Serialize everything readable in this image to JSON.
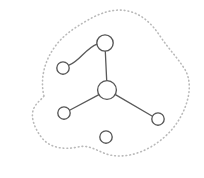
{
  "diagram": {
    "canvas": {
      "width": 204,
      "height": 178,
      "background": "#ffffff"
    },
    "styles": {
      "node_fill": "#ffffff",
      "node_stroke": "#555555",
      "node_stroke_width": 1.35,
      "edge_stroke": "#595959",
      "edge_stroke_width": 1.3,
      "boundary_stroke": "#b9b9b9",
      "boundary_stroke_width": 1.6,
      "boundary_dash": "0.7 3.1"
    },
    "nodes": [
      {
        "id": "n-top",
        "label": "",
        "cx": 105,
        "cy": 43,
        "r": 8.2,
        "size": "medium"
      },
      {
        "id": "n-upper-left",
        "label": "",
        "cx": 63,
        "cy": 68,
        "r": 6.2,
        "size": "small"
      },
      {
        "id": "n-hub",
        "label": "",
        "cx": 107,
        "cy": 90,
        "r": 9.4,
        "size": "large"
      },
      {
        "id": "n-lower-left",
        "label": "",
        "cx": 64,
        "cy": 113,
        "r": 6.2,
        "size": "small"
      },
      {
        "id": "n-lower-right",
        "label": "",
        "cx": 158,
        "cy": 119,
        "r": 6.2,
        "size": "small"
      },
      {
        "id": "n-isolated",
        "label": "",
        "cx": 106,
        "cy": 137,
        "r": 6.2,
        "size": "small"
      }
    ],
    "edges": [
      {
        "id": "e-curved-upperleft-top",
        "from": "n-upper-left",
        "to": "n-top",
        "type": "curved",
        "path": "M 69.0 65.2 C 80.0 61.0 85.5 48.5 96.9 44.1"
      },
      {
        "id": "e-top-hub",
        "from": "n-top",
        "to": "n-hub",
        "type": "straight",
        "path": "M 105.3 51.2 L 106.7 80.6"
      },
      {
        "id": "e-hub-lowerleft",
        "from": "n-hub",
        "to": "n-lower-left",
        "type": "straight",
        "path": "M 99.0 94.6 L 69.6 110.2"
      },
      {
        "id": "e-hub-lowerright",
        "from": "n-hub",
        "to": "n-lower-right",
        "type": "straight",
        "path": "M 115.4 94.6 L 152.4 116.2"
      }
    ],
    "boundary": {
      "id": "region-boundary",
      "type": "closed-dotted-blob",
      "path": "M 44 96 C 40 80 44 62 54 48 C 62 36 74 28 88 20 C 100 13 114 8 128 11 C 142 14 152 24 160 36 C 168 48 176 56 184 68 C 192 80 190 96 184 110 C 178 124 168 136 154 145 C 140 154 124 158 110 155 C 98 152 90 144 78 147 C 64 150 50 148 42 138 C 34 128 30 116 34 108 C 37 102 41 100 44 96 Z"
    },
    "isolated_nodes": [
      "n-isolated"
    ],
    "counts": {
      "nodes": 6,
      "edges": 4,
      "components": 2
    }
  }
}
